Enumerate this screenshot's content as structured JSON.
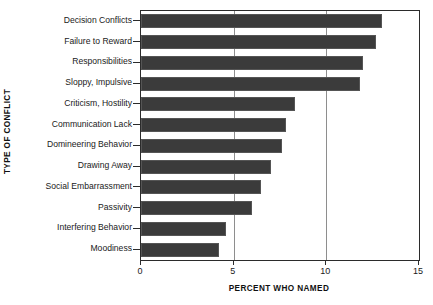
{
  "chart_data": {
    "type": "bar",
    "orientation": "horizontal",
    "title": "",
    "xlabel": "PERCENT WHO NAMED",
    "ylabel": "TYPE OF CONFLICT",
    "xlim": [
      0,
      15
    ],
    "xticks": [
      "0",
      "5",
      "10",
      "15"
    ],
    "xtick_values": [
      0,
      5,
      10,
      15
    ],
    "grid": "vertical gridlines at 5 and 10",
    "legend": "none",
    "categories": [
      "Decision Conflicts",
      "Failure to Reward",
      "Responsibilities",
      "Sloppy, Impulsive",
      "Criticism, Hostility",
      "Communication Lack",
      "Domineering Behavior",
      "Drawing Away",
      "Social Embarrassment",
      "Passivity",
      "Interfering Behavior",
      "Moodiness"
    ],
    "values": [
      13.0,
      12.7,
      12.0,
      11.8,
      8.3,
      7.8,
      7.6,
      7.0,
      6.5,
      6.0,
      4.6,
      4.2
    ],
    "bar_color": "#3b3b3b",
    "gridline_color": "#8e8e8e",
    "axis_color": "#2b2b2b"
  }
}
